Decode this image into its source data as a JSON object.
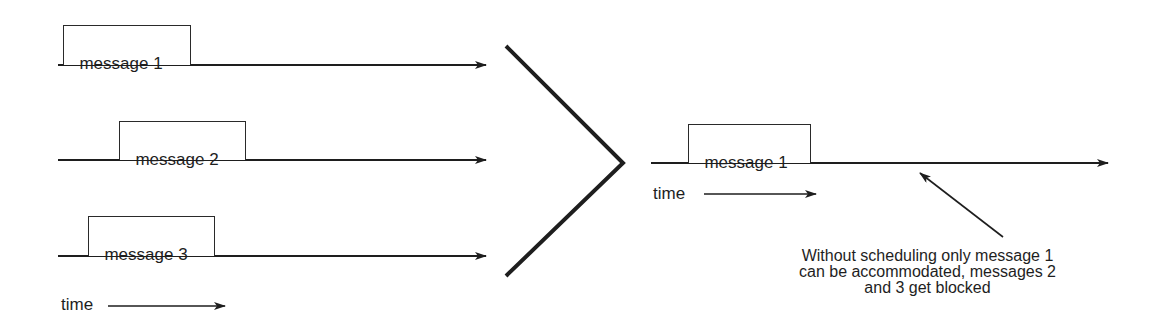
{
  "left_panel": {
    "timelines": [
      {
        "label": "message 1"
      },
      {
        "label": "message 2"
      },
      {
        "label": "message 3"
      }
    ],
    "time_label": "time"
  },
  "right_panel": {
    "timeline": {
      "label": "message 1"
    },
    "time_label": "time",
    "annotation": "Without  scheduling only  message  1\ncan  be accommodated,  messages  2\nand  3  get  blocked"
  },
  "colors": {
    "stroke": "#1e1e1e",
    "background": "#ffffff"
  }
}
